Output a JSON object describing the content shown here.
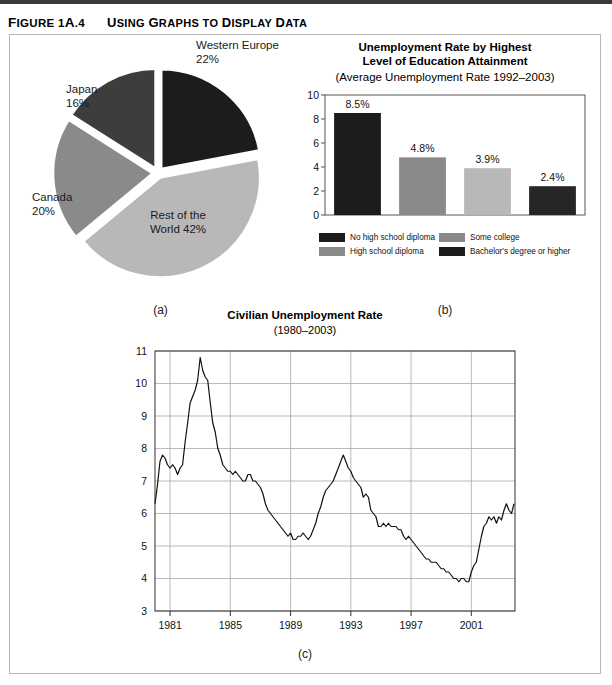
{
  "figure": {
    "number": "Figure 1A.4",
    "title": "Using Graphs to Display Data"
  },
  "panels": {
    "a": {
      "caption": "(a)"
    },
    "b": {
      "caption": "(b)"
    },
    "c": {
      "caption": "(c)"
    }
  },
  "colors": {
    "darkest": "#1c1c1c",
    "dark": "#3d3d3d",
    "mid": "#8a8a8a",
    "light": "#b8b8b8",
    "grid": "#a9a9a9",
    "axis": "#555555",
    "line": "#111111",
    "frame": "#b5b5b5"
  },
  "chart_data": [
    {
      "type": "pie",
      "title": "",
      "panel": "(a)",
      "start_angle_deg": 0,
      "direction": "clockwise",
      "exploded": true,
      "categories": [
        "Western Europe",
        "Rest of the World",
        "Canada",
        "Japan"
      ],
      "values": [
        22,
        42,
        20,
        16
      ],
      "unit": "%",
      "slices": [
        {
          "label": "Western Europe",
          "value": 22,
          "label_text": "Western Europe",
          "value_text": "22%",
          "color": "#1c1c1c",
          "label_pos": "outside-top-right"
        },
        {
          "label": "Rest of the World",
          "value": 42,
          "label_text": "Rest of the",
          "value_text": "World 42%",
          "color": "#b8b8b8",
          "label_pos": "inside"
        },
        {
          "label": "Canada",
          "value": 20,
          "label_text": "Canada",
          "value_text": "20%",
          "color": "#8a8a8a",
          "label_pos": "outside-left"
        },
        {
          "label": "Japan",
          "value": 16,
          "label_text": "Japan",
          "value_text": "16%",
          "color": "#3d3d3d",
          "label_pos": "outside-top-left"
        }
      ]
    },
    {
      "type": "bar",
      "panel": "(b)",
      "title_line1": "Unemployment Rate by Highest",
      "title_line2": "Level of Education Attainment",
      "subtitle": "(Average Unemployment Rate 1992–2003)",
      "categories": [
        "No high school diploma",
        "High school diploma",
        "Some college",
        "Bachelor's degree or higher"
      ],
      "values": [
        8.5,
        4.8,
        3.9,
        2.4
      ],
      "data_labels": [
        "8.5%",
        "4.8%",
        "3.9%",
        "2.4%"
      ],
      "bar_colors": [
        "#1c1c1c",
        "#8a8a8a",
        "#b8b8b8",
        "#262626"
      ],
      "ylim": [
        0,
        10
      ],
      "yticks": [
        0,
        2,
        4,
        6,
        8,
        10
      ],
      "ytick_labels": [
        "0",
        "2",
        "4",
        "6",
        "8",
        "10"
      ],
      "xlabel": "",
      "ylabel": "",
      "grid": false,
      "legend": {
        "position": "below",
        "entries": [
          {
            "label": "No high school diploma",
            "color": "#1c1c1c"
          },
          {
            "label": "Some college",
            "color": "#8a8a8a"
          },
          {
            "label": "High school diploma",
            "color": "#8a8a8a"
          },
          {
            "label": "Bachelor's degree or higher",
            "color": "#1c1c1c"
          }
        ]
      }
    },
    {
      "type": "line",
      "panel": "(c)",
      "title": "Civilian Unemployment  Rate",
      "subtitle": "(1980–2003)",
      "xlabel": "",
      "ylabel": "",
      "ylim": [
        3,
        11
      ],
      "yticks": [
        3,
        4,
        5,
        6,
        7,
        8,
        9,
        10,
        11
      ],
      "ytick_labels": [
        "3",
        "4",
        "5",
        "6",
        "7",
        "8",
        "9",
        "10",
        "11"
      ],
      "xlim": [
        1980,
        2003.9
      ],
      "xticks": [
        1981,
        1985,
        1989,
        1993,
        1997,
        2001
      ],
      "xtick_labels": [
        "1981",
        "1985",
        "1989",
        "1993",
        "1997",
        "2001"
      ],
      "grid": true,
      "series_name": "Civilian Unemployment Rate",
      "x": [
        1980.0,
        1980.17,
        1980.33,
        1980.5,
        1980.67,
        1980.83,
        1981.0,
        1981.17,
        1981.33,
        1981.5,
        1981.67,
        1981.83,
        1982.0,
        1982.17,
        1982.33,
        1982.5,
        1982.67,
        1982.83,
        1983.0,
        1983.17,
        1983.33,
        1983.5,
        1983.67,
        1983.83,
        1984.0,
        1984.17,
        1984.33,
        1984.5,
        1984.67,
        1984.83,
        1985.0,
        1985.17,
        1985.33,
        1985.5,
        1985.67,
        1985.83,
        1986.0,
        1986.17,
        1986.33,
        1986.5,
        1986.67,
        1986.83,
        1987.0,
        1987.17,
        1987.33,
        1987.5,
        1987.67,
        1987.83,
        1988.0,
        1988.17,
        1988.33,
        1988.5,
        1988.67,
        1988.83,
        1989.0,
        1989.17,
        1989.33,
        1989.5,
        1989.67,
        1989.83,
        1990.0,
        1990.17,
        1990.33,
        1990.5,
        1990.67,
        1990.83,
        1991.0,
        1991.17,
        1991.33,
        1991.5,
        1991.67,
        1991.83,
        1992.0,
        1992.17,
        1992.33,
        1992.5,
        1992.67,
        1992.83,
        1993.0,
        1993.17,
        1993.33,
        1993.5,
        1993.67,
        1993.83,
        1994.0,
        1994.17,
        1994.33,
        1994.5,
        1994.67,
        1994.83,
        1995.0,
        1995.17,
        1995.33,
        1995.5,
        1995.67,
        1995.83,
        1996.0,
        1996.17,
        1996.33,
        1996.5,
        1996.67,
        1996.83,
        1997.0,
        1997.17,
        1997.33,
        1997.5,
        1997.67,
        1997.83,
        1998.0,
        1998.17,
        1998.33,
        1998.5,
        1998.67,
        1998.83,
        1999.0,
        1999.17,
        1999.33,
        1999.5,
        1999.67,
        1999.83,
        2000.0,
        2000.17,
        2000.33,
        2000.5,
        2000.67,
        2000.83,
        2001.0,
        2001.17,
        2001.33,
        2001.5,
        2001.67,
        2001.83,
        2002.0,
        2002.17,
        2002.33,
        2002.5,
        2002.67,
        2002.83,
        2003.0,
        2003.17,
        2003.33,
        2003.5,
        2003.67,
        2003.83
      ],
      "y": [
        6.3,
        6.9,
        7.6,
        7.8,
        7.7,
        7.5,
        7.4,
        7.5,
        7.4,
        7.2,
        7.4,
        7.5,
        8.2,
        8.8,
        9.4,
        9.6,
        9.8,
        10.1,
        10.8,
        10.4,
        10.2,
        10.1,
        9.4,
        8.8,
        8.5,
        8.0,
        7.8,
        7.5,
        7.4,
        7.3,
        7.3,
        7.2,
        7.3,
        7.2,
        7.1,
        7.0,
        7.0,
        7.2,
        7.2,
        7.0,
        7.0,
        6.9,
        6.8,
        6.6,
        6.3,
        6.1,
        6.0,
        5.9,
        5.8,
        5.7,
        5.6,
        5.5,
        5.4,
        5.3,
        5.4,
        5.2,
        5.2,
        5.3,
        5.3,
        5.4,
        5.3,
        5.2,
        5.3,
        5.5,
        5.7,
        6.0,
        6.2,
        6.5,
        6.7,
        6.8,
        6.9,
        7.0,
        7.2,
        7.4,
        7.6,
        7.8,
        7.6,
        7.4,
        7.3,
        7.1,
        7.0,
        6.9,
        6.8,
        6.5,
        6.6,
        6.5,
        6.1,
        6.0,
        5.9,
        5.6,
        5.6,
        5.7,
        5.6,
        5.7,
        5.6,
        5.6,
        5.6,
        5.5,
        5.5,
        5.3,
        5.2,
        5.3,
        5.2,
        5.1,
        5.0,
        4.9,
        4.8,
        4.7,
        4.6,
        4.6,
        4.5,
        4.5,
        4.5,
        4.4,
        4.3,
        4.3,
        4.2,
        4.2,
        4.1,
        4.0,
        4.0,
        3.9,
        4.0,
        4.0,
        3.9,
        3.9,
        4.2,
        4.4,
        4.5,
        4.9,
        5.3,
        5.6,
        5.7,
        5.9,
        5.8,
        5.9,
        5.7,
        5.9,
        5.8,
        6.1,
        6.3,
        6.1,
        6.0,
        6.3
      ]
    }
  ]
}
